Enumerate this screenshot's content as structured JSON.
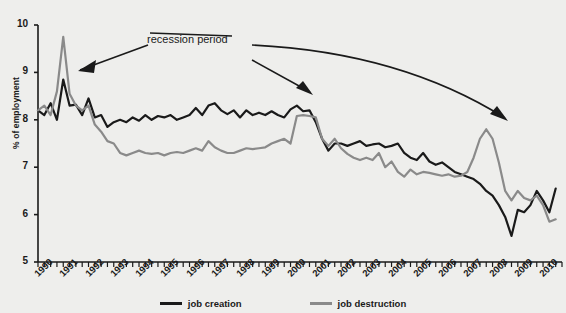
{
  "chart_data": {
    "type": "line",
    "title": "",
    "xlabel": "",
    "ylabel": "% of employment",
    "ylim": [
      5,
      10
    ],
    "yticks": [
      5,
      6,
      7,
      8,
      9,
      10
    ],
    "xlim": [
      1990,
      2010.75
    ],
    "xticks": [
      "1990",
      "1991",
      "1992",
      "1993",
      "1994",
      "1995",
      "1996",
      "1997",
      "1998",
      "1999",
      "2000",
      "2001",
      "2002",
      "2003",
      "2004",
      "2005",
      "2006",
      "2007",
      "2008",
      "2009",
      "2010"
    ],
    "x_tick_interval": "quarterly minor ticks, annual labels",
    "grid": false,
    "legend_position": "bottom-center",
    "colors": {
      "job_creation": "#1a1a1a",
      "job_destruction": "#8a8a8a",
      "background": "#eeeeec"
    },
    "annotations": [
      {
        "text": "recession period",
        "points_to": [
          "1991",
          "2001",
          "2008"
        ]
      }
    ],
    "series": [
      {
        "name": "job creation",
        "color": "#1a1a1a",
        "x": [
          1990.0,
          1990.25,
          1990.5,
          1990.75,
          1991.0,
          1991.25,
          1991.5,
          1991.75,
          1992.0,
          1992.25,
          1992.5,
          1992.75,
          1993.0,
          1993.25,
          1993.5,
          1993.75,
          1994.0,
          1994.25,
          1994.5,
          1994.75,
          1995.0,
          1995.25,
          1995.5,
          1995.75,
          1996.0,
          1996.25,
          1996.5,
          1996.75,
          1997.0,
          1997.25,
          1997.5,
          1997.75,
          1998.0,
          1998.25,
          1998.5,
          1998.75,
          1999.0,
          1999.25,
          1999.5,
          1999.75,
          2000.0,
          2000.25,
          2000.5,
          2000.75,
          2001.0,
          2001.25,
          2001.5,
          2001.75,
          2002.0,
          2002.25,
          2002.5,
          2002.75,
          2003.0,
          2003.25,
          2003.5,
          2003.75,
          2004.0,
          2004.25,
          2004.5,
          2004.75,
          2005.0,
          2005.25,
          2005.5,
          2005.75,
          2006.0,
          2006.25,
          2006.5,
          2006.75,
          2007.0,
          2007.25,
          2007.5,
          2007.75,
          2008.0,
          2008.25,
          2008.5,
          2008.75,
          2009.0,
          2009.25,
          2009.5,
          2009.75,
          2010.0,
          2010.25,
          2010.5
        ],
        "y": [
          8.2,
          8.1,
          8.35,
          8.0,
          8.85,
          8.3,
          8.32,
          8.1,
          8.45,
          8.05,
          8.1,
          7.85,
          7.95,
          8.0,
          7.95,
          8.05,
          7.98,
          8.1,
          8.0,
          8.08,
          8.05,
          8.1,
          8.0,
          8.05,
          8.1,
          8.25,
          8.1,
          8.3,
          8.35,
          8.2,
          8.12,
          8.2,
          8.05,
          8.2,
          8.1,
          8.15,
          8.1,
          8.18,
          8.1,
          8.05,
          8.22,
          8.3,
          8.18,
          8.2,
          7.95,
          7.6,
          7.35,
          7.5,
          7.5,
          7.45,
          7.5,
          7.55,
          7.45,
          7.48,
          7.5,
          7.42,
          7.45,
          7.5,
          7.3,
          7.2,
          7.15,
          7.3,
          7.12,
          7.05,
          7.1,
          7.0,
          6.9,
          6.85,
          6.8,
          6.75,
          6.65,
          6.5,
          6.4,
          6.2,
          5.95,
          5.55,
          6.1,
          6.05,
          6.2,
          6.5,
          6.3,
          6.05,
          6.55
        ]
      },
      {
        "name": "job destruction",
        "color": "#8a8a8a",
        "x": [
          1990.0,
          1990.25,
          1990.5,
          1990.75,
          1991.0,
          1991.25,
          1991.5,
          1991.75,
          1992.0,
          1992.25,
          1992.5,
          1992.75,
          1993.0,
          1993.25,
          1993.5,
          1993.75,
          1994.0,
          1994.25,
          1994.5,
          1994.75,
          1995.0,
          1995.25,
          1995.5,
          1995.75,
          1996.0,
          1996.25,
          1996.5,
          1996.75,
          1997.0,
          1997.25,
          1997.5,
          1997.75,
          1998.0,
          1998.25,
          1998.5,
          1998.75,
          1999.0,
          1999.25,
          1999.5,
          1999.75,
          2000.0,
          2000.25,
          2000.5,
          2000.75,
          2001.0,
          2001.25,
          2001.5,
          2001.75,
          2002.0,
          2002.25,
          2002.5,
          2002.75,
          2003.0,
          2003.25,
          2003.5,
          2003.75,
          2004.0,
          2004.25,
          2004.5,
          2004.75,
          2005.0,
          2005.25,
          2005.5,
          2005.75,
          2006.0,
          2006.25,
          2006.5,
          2006.75,
          2007.0,
          2007.25,
          2007.5,
          2007.75,
          2008.0,
          2008.25,
          2008.5,
          2008.75,
          2009.0,
          2009.25,
          2009.5,
          2009.75,
          2010.0,
          2010.25,
          2010.5
        ],
        "y": [
          8.2,
          8.3,
          8.1,
          8.6,
          9.75,
          8.55,
          8.3,
          8.2,
          8.3,
          7.9,
          7.75,
          7.55,
          7.5,
          7.3,
          7.25,
          7.3,
          7.35,
          7.3,
          7.28,
          7.3,
          7.25,
          7.3,
          7.32,
          7.3,
          7.35,
          7.4,
          7.35,
          7.55,
          7.42,
          7.35,
          7.3,
          7.3,
          7.35,
          7.4,
          7.38,
          7.4,
          7.42,
          7.5,
          7.55,
          7.6,
          7.5,
          8.08,
          8.1,
          8.08,
          8.05,
          7.6,
          7.45,
          7.6,
          7.4,
          7.28,
          7.2,
          7.15,
          7.2,
          7.15,
          7.3,
          7.0,
          7.12,
          6.9,
          6.8,
          6.95,
          6.85,
          6.9,
          6.88,
          6.85,
          6.82,
          6.85,
          6.8,
          6.82,
          6.9,
          7.2,
          7.6,
          7.8,
          7.6,
          7.1,
          6.5,
          6.3,
          6.5,
          6.35,
          6.3,
          6.4,
          6.2,
          5.85,
          5.9
        ]
      }
    ]
  },
  "legend": {
    "items": [
      {
        "label": "job creation",
        "color": "#1a1a1a"
      },
      {
        "label": "job destruction",
        "color": "#8a8a8a"
      }
    ]
  },
  "annotation": {
    "recession_label": "recession period"
  },
  "axis": {
    "y_title": "% of employment"
  }
}
